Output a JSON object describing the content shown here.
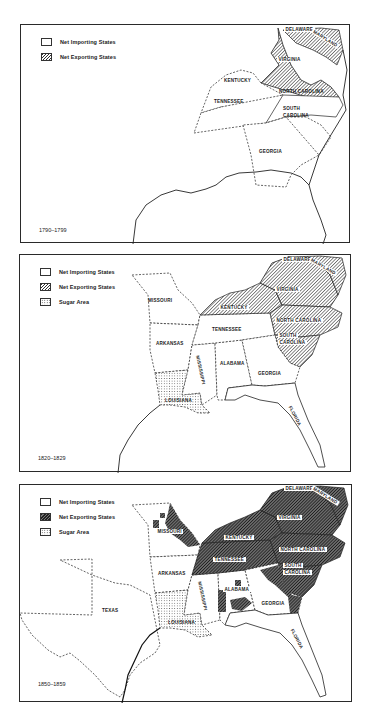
{
  "figure": {
    "colors": {
      "ink": "#222222",
      "importing_fill": "#ffffff",
      "exporting_hatch": "#333333",
      "sugar_dots": "#333333",
      "background": "#ffffff"
    }
  },
  "legend_keys": {
    "importing": "Net Importing States",
    "exporting": "Net Exporting States",
    "sugar": "Sugar Area"
  },
  "maps": [
    {
      "period": "1790–1799",
      "legend": [
        "Net Importing States",
        "Net Exporting States"
      ],
      "states": {
        "delaware": "DELAWARE",
        "maryland": "MARYLAND",
        "virginia": "VIRGINIA",
        "kentucky": "KENTUCKY",
        "north_carolina": "NORTH CAROLINA",
        "tennessee": "TENNESSEE",
        "south_carolina_1": "SOUTH",
        "south_carolina_2": "CAROLINA",
        "georgia": "GEORGIA"
      },
      "exporting_states": [
        "VIRGINIA",
        "MARYLAND",
        "DELAWARE"
      ],
      "importing_states": [
        "KENTUCKY",
        "NORTH CAROLINA",
        "TENNESSEE",
        "SOUTH CAROLINA",
        "GEORGIA"
      ],
      "sugar_areas": []
    },
    {
      "period": "1820–1829",
      "legend": [
        "Net Importing States",
        "Net Exporting States",
        "Sugar Area"
      ],
      "states": {
        "delaware": "DELAWARE",
        "maryland": "MARYLAND",
        "virginia": "VIRGINIA",
        "missouri": "MISSOURI",
        "kentucky": "KENTUCKY",
        "north_carolina": "NORTH CAROLINA",
        "tennessee": "TENNESSEE",
        "south_carolina_1": "SOUTH",
        "south_carolina_2": "CAROLINA",
        "arkansas": "ARKANSAS",
        "mississippi": "MISSISSIPPI",
        "alabama": "ALABAMA",
        "georgia": "GEORGIA",
        "louisiana": "LOUISIANA",
        "florida": "FLORIDA"
      },
      "exporting_states": [
        "VIRGINIA",
        "MARYLAND",
        "DELAWARE",
        "KENTUCKY",
        "NORTH CAROLINA",
        "SOUTH CAROLINA"
      ],
      "importing_states": [
        "MISSOURI",
        "TENNESSEE",
        "ARKANSAS",
        "MISSISSIPPI",
        "ALABAMA",
        "GEORGIA",
        "FLORIDA"
      ],
      "sugar_areas": [
        "LOUISIANA"
      ]
    },
    {
      "period": "1850–1859",
      "legend": [
        "Net Importing States",
        "Net Exporting States",
        "Sugar Area"
      ],
      "states": {
        "delaware": "DELAWARE",
        "maryland": "MARYLAND",
        "virginia": "VIRGINIA",
        "missouri": "MISSOURI",
        "kentucky": "KENTUCKY",
        "north_carolina": "NORTH CAROLINA",
        "tennessee": "TENNESSEE",
        "south_carolina_1": "SOUTH",
        "south_carolina_2": "CAROLINA",
        "arkansas": "ARKANSAS",
        "mississippi": "MISSISSIPPI",
        "alabama": "ALABAMA",
        "georgia": "GEORGIA",
        "texas": "TEXAS",
        "louisiana": "LOUISIANA",
        "florida": "FLORIDA"
      },
      "exporting_states": [
        "VIRGINIA",
        "MARYLAND",
        "DELAWARE",
        "KENTUCKY",
        "NORTH CAROLINA",
        "SOUTH CAROLINA",
        "TENNESSEE",
        "MISSOURI (partial)",
        "ALABAMA (partial)",
        "GEORGIA (partial)"
      ],
      "importing_states": [
        "TEXAS",
        "ARKANSAS",
        "MISSISSIPPI",
        "ALABAMA",
        "GEORGIA",
        "FLORIDA",
        "MISSOURI"
      ],
      "sugar_areas": [
        "LOUISIANA"
      ]
    }
  ]
}
